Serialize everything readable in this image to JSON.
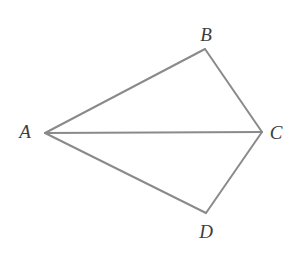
{
  "figure": {
    "canvas": {
      "width": 301,
      "height": 253,
      "background": "#ffffff"
    },
    "style": {
      "stroke_color": "#8a8a8a",
      "stroke_width": 2,
      "label_color": "#3d3d3d",
      "label_font_size": 19,
      "label_style": "italic-serif"
    },
    "vertices": [
      {
        "id": "A",
        "label": "A",
        "x": 45,
        "y": 133,
        "label_x": 25,
        "label_y": 131
      },
      {
        "id": "B",
        "label": "B",
        "x": 205,
        "y": 49,
        "label_x": 206,
        "label_y": 34
      },
      {
        "id": "C",
        "label": "C",
        "x": 262,
        "y": 132,
        "label_x": 276,
        "label_y": 132
      },
      {
        "id": "D",
        "label": "D",
        "x": 206,
        "y": 213,
        "label_x": 206,
        "label_y": 231
      }
    ],
    "segments": [
      {
        "id": "AB",
        "from": "A",
        "to": "B",
        "kind": "side"
      },
      {
        "id": "BC",
        "from": "B",
        "to": "C",
        "kind": "side"
      },
      {
        "id": "CD",
        "from": "C",
        "to": "D",
        "kind": "side"
      },
      {
        "id": "DA",
        "from": "D",
        "to": "A",
        "kind": "side"
      },
      {
        "id": "AC",
        "from": "A",
        "to": "C",
        "kind": "diagonal"
      }
    ]
  },
  "chart_data": {
    "type": "diagram",
    "points": {
      "A": [
        45,
        133
      ],
      "B": [
        205,
        49
      ],
      "C": [
        262,
        132
      ],
      "D": [
        206,
        213
      ]
    },
    "edges": [
      [
        "A",
        "B"
      ],
      [
        "B",
        "C"
      ],
      [
        "C",
        "D"
      ],
      [
        "D",
        "A"
      ],
      [
        "A",
        "C"
      ]
    ],
    "labels": [
      "A",
      "B",
      "C",
      "D"
    ]
  }
}
